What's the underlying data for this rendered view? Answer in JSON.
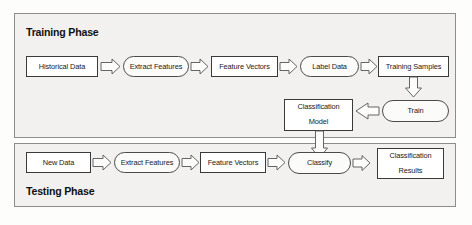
{
  "diagram": {
    "colors": {
      "panel_fill": "#f2f1ef",
      "panel_stroke": "#8d8d8d",
      "box_fill": "#ffffff",
      "box_stroke": "#3a3a3a",
      "arrow_fill": "#fcfcfb",
      "arrow_stroke": "#555555",
      "text": "#1a1a1a",
      "background": "#fdfdfc"
    },
    "panels": [
      {
        "id": "training",
        "label": "Training Phase"
      },
      {
        "id": "testing",
        "label": "Testing Phase"
      }
    ],
    "nodes": {
      "historical_data": "Historical Data",
      "extract_features_train": "Extract Features",
      "feature_vectors_train": "Feature Vectors",
      "label_data": "Label Data",
      "training_samples": "Training Samples",
      "train": "Train",
      "classification_model_line1": "Classification",
      "classification_model_line2": "Model",
      "new_data": "New Data",
      "extract_features_test": "Extract Features",
      "feature_vectors_test": "Feature Vectors",
      "classify": "Classify",
      "classification_results_line1": "Classification",
      "classification_results_line2": "Results"
    },
    "background_ghost_text": {
      "line1": "on of the proposed ensemble model",
      "line2": "the classification task",
      "line3": "the model is trained with",
      "line4": "to predict the class labels",
      "line5": "dataset samples are",
      "line6": "classifier is built from"
    }
  }
}
